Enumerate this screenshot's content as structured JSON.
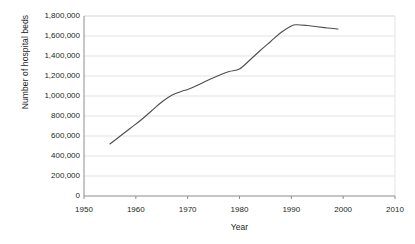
{
  "chart_data": {
    "type": "line",
    "title": "",
    "xlabel": "Year",
    "ylabel": "Number of hospital beds",
    "xlim": [
      1950,
      2010
    ],
    "ylim": [
      0,
      1800000
    ],
    "grid": "horizontal",
    "legend": "none",
    "x_ticks": [
      1950,
      1960,
      1970,
      1980,
      1990,
      2000,
      2010
    ],
    "x_tick_labels": [
      "1950",
      "1960",
      "1970",
      "1980",
      "1990",
      "2000",
      "2010"
    ],
    "y_ticks": [
      0,
      200000,
      400000,
      600000,
      800000,
      1000000,
      1200000,
      1400000,
      1600000,
      1800000
    ],
    "y_tick_labels": [
      "0",
      "200,000",
      "400,000",
      "600,000",
      "800,000",
      "1,000,000",
      "1,200,000",
      "1,400,000",
      "1,600,000",
      "1,800,000"
    ],
    "series": [
      {
        "name": "Number of hospital beds",
        "color": "#4d4d52",
        "x": [
          1955,
          1957,
          1959,
          1961,
          1963,
          1965,
          1967,
          1969,
          1970,
          1972,
          1974,
          1976,
          1978,
          1980,
          1982,
          1984,
          1986,
          1988,
          1990,
          1991,
          1993,
          1995,
          1997,
          1999
        ],
        "values": [
          520000,
          600000,
          680000,
          760000,
          850000,
          940000,
          1010000,
          1050000,
          1065000,
          1110000,
          1160000,
          1205000,
          1245000,
          1270000,
          1360000,
          1455000,
          1545000,
          1635000,
          1700000,
          1712000,
          1705000,
          1692000,
          1680000,
          1670000
        ]
      }
    ]
  },
  "axes": {
    "plot_left": 84,
    "plot_right": 395,
    "plot_top": 16,
    "plot_bottom": 196
  },
  "colors": {
    "line": "#4d4d52",
    "gridline": "#e3e3e5",
    "axis": "#8c8c8c",
    "text": "#231f20",
    "background": "#ffffff"
  }
}
